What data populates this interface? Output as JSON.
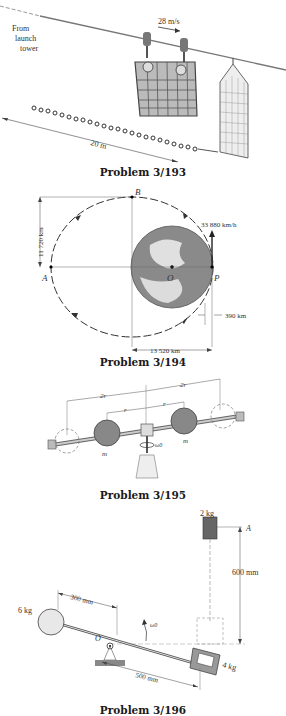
{
  "figures": [
    {
      "caption": "Problem 3/193",
      "labels": {
        "from": "From",
        "launch": "launch",
        "tower": "tower",
        "speed": "28 m/s",
        "distance": "20 m"
      }
    },
    {
      "caption": "Problem 3/194",
      "labels": {
        "point_b": "B",
        "point_a": "A",
        "point_o": "O",
        "point_p": "P",
        "velocity": "33 880 km/h",
        "minor_axis": "11 720 km",
        "altitude": "390 km",
        "major_dist": "13 520 km"
      }
    },
    {
      "caption": "Problem 3/195",
      "labels": {
        "outer_left": "2r",
        "outer_right": "2r",
        "inner_left": "r",
        "inner_right": "r",
        "mass_left": "m",
        "mass_right": "m",
        "omega": "ω0"
      }
    },
    {
      "caption": "Problem 3/196",
      "labels": {
        "top_mass": "2 kg",
        "point_a": "A",
        "height": "600 mm",
        "left_mass": "6 kg",
        "left_len": "300 mm",
        "pivot": "O",
        "omega": "ω0",
        "right_mass": "4 kg",
        "right_len": "500 mm"
      }
    }
  ]
}
